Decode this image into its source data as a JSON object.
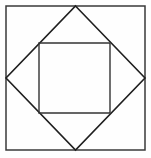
{
  "figure": {
    "title": "Nested squares and inscribed diamond",
    "background_color": "#fefefe",
    "canvas": {
      "width": 151,
      "height": 158
    },
    "shapes": [
      {
        "name": "outer-square",
        "type": "rectangle",
        "stroke_color": "#3a3a3a",
        "stroke_width": 1.5,
        "fill": "none",
        "x": 6,
        "y": 6,
        "width": 139,
        "height": 144,
        "points": "6,6 145,6 145,150 6,150"
      },
      {
        "name": "diamond",
        "type": "polygon",
        "stroke_color": "#1f1f1f",
        "stroke_width": 1.6,
        "fill": "none",
        "vertices": {
          "top": "75.5,6",
          "right": "145,78",
          "bottom": "75.5,150",
          "left": "6,78"
        },
        "points": "75.5,6 145,78 75.5,150 6,78"
      },
      {
        "name": "inner-square",
        "type": "rectangle",
        "stroke_color": "#333333",
        "stroke_width": 1.4,
        "fill": "none",
        "x": 39,
        "y": 43,
        "width": 71,
        "height": 70,
        "points": "39,43 110,43 110,113 39,113"
      }
    ]
  }
}
